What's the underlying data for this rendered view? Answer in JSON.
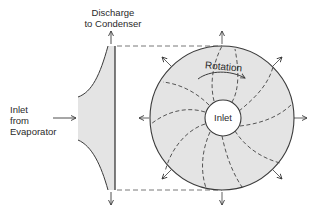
{
  "diagram": {
    "type": "centrifugal-compressor-schematic",
    "labels": {
      "discharge_line1": "Discharge",
      "discharge_line2": "to Condenser",
      "inlet_side_line1": "Inlet",
      "inlet_side_line2": "from",
      "inlet_side_line3": "Evaporator",
      "rotation": "Rotation",
      "inlet_center": "Inlet"
    },
    "colors": {
      "stroke": "#3a3a3a",
      "fill": "#e4e4e4",
      "background": "#ffffff"
    }
  }
}
